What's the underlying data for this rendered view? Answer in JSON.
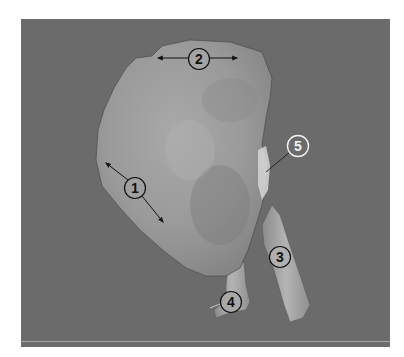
{
  "figure": {
    "background_color": "#6b6b6b",
    "specimen_color": "#9c9c9c",
    "labels": [
      {
        "id": "1",
        "text": "1",
        "style": "dark"
      },
      {
        "id": "2",
        "text": "2",
        "style": "dark"
      },
      {
        "id": "3",
        "text": "3",
        "style": "dark"
      },
      {
        "id": "4",
        "text": "4",
        "style": "dark"
      },
      {
        "id": "5",
        "text": "5",
        "style": "light"
      }
    ]
  }
}
